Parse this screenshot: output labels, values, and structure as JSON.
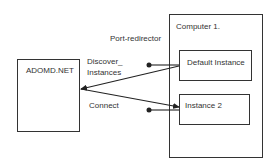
{
  "diagram": {
    "nodes": {
      "client": {
        "label": "ADOMD.NET"
      },
      "computer": {
        "label": "Computer 1."
      },
      "default_instance": {
        "label": "Default Instance"
      },
      "instance2": {
        "label": "Instance 2"
      }
    },
    "edges": {
      "port_redirector": {
        "label": "Port-redirector"
      },
      "discover": {
        "label_line1": "Discover_",
        "label_line2": "Instances"
      },
      "connect": {
        "label": "Connect"
      }
    },
    "colors": {
      "stroke": "#222222",
      "background": "#ffffff"
    }
  }
}
